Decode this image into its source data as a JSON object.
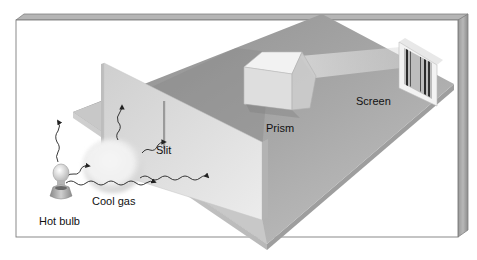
{
  "figure": {
    "labels": {
      "hot_bulb": "Hot bulb",
      "cool_gas": "Cool gas",
      "slit": "Slit",
      "prism": "Prism",
      "screen": "Screen"
    },
    "colors": {
      "background": "#ffffff",
      "frame_edge": "#8a8a8a",
      "frame_side": "#a8a8a8",
      "board_top": "#b4b4b4",
      "board_shadow": "#7c7c7c",
      "wall": "#dcdcdc",
      "prism": "#e6e6e6",
      "gas_cloud": "#ececec",
      "spectrum_lines": "#2a2a2a"
    }
  }
}
